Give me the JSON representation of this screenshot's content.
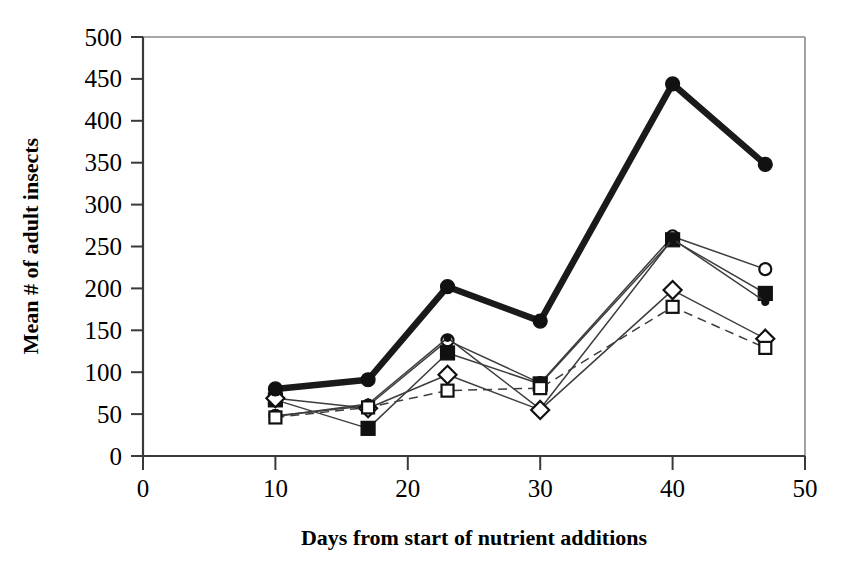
{
  "figure": {
    "title": "",
    "background": "#ffffff",
    "ink_color": "#111111"
  },
  "axes": {
    "x_title": "Days from start of nutrient additions",
    "y_title": "Mean # of adult insects",
    "x_ticks": [
      "0",
      "10",
      "20",
      "30",
      "40",
      "50"
    ],
    "y_ticks": [
      "0",
      "50",
      "100",
      "150",
      "200",
      "250",
      "300",
      "350",
      "400",
      "450",
      "500"
    ]
  },
  "chart_data": {
    "type": "line",
    "title": "",
    "xlabel": "Days from start of nutrient additions",
    "ylabel": "Mean # of adult insects",
    "xlim": [
      0,
      50
    ],
    "ylim": [
      0,
      500
    ],
    "xticks": [
      0,
      10,
      20,
      30,
      40,
      50
    ],
    "yticks": [
      0,
      50,
      100,
      150,
      200,
      250,
      300,
      350,
      400,
      450,
      500
    ],
    "grid": false,
    "legend": "none",
    "x": [
      10,
      17,
      23,
      30,
      40,
      47
    ],
    "series": [
      {
        "name": "series-1-thick-filled-circle",
        "marker": "filled-circle",
        "line": "thick-solid",
        "values": [
          80,
          91,
          202,
          161,
          444,
          348
        ]
      },
      {
        "name": "series-2-open-circle",
        "marker": "open-circle",
        "line": "thin-solid",
        "values": [
          48,
          60,
          138,
          87,
          262,
          223
        ]
      },
      {
        "name": "series-3-filled-square",
        "marker": "filled-square",
        "line": "thin-solid",
        "values": [
          67,
          33,
          123,
          86,
          258,
          194
        ]
      },
      {
        "name": "series-4-small-filled-dot",
        "marker": "small-filled-dot",
        "line": "thin-solid",
        "values": [
          47,
          62,
          141,
          56,
          259,
          184
        ]
      },
      {
        "name": "series-5-open-diamond",
        "marker": "open-diamond",
        "line": "thin-solid",
        "values": [
          69,
          57,
          97,
          55,
          198,
          140
        ]
      },
      {
        "name": "series-6-open-square",
        "marker": "open-square",
        "line": "dashed",
        "values": [
          46,
          58,
          78,
          81,
          178,
          129
        ]
      }
    ]
  }
}
